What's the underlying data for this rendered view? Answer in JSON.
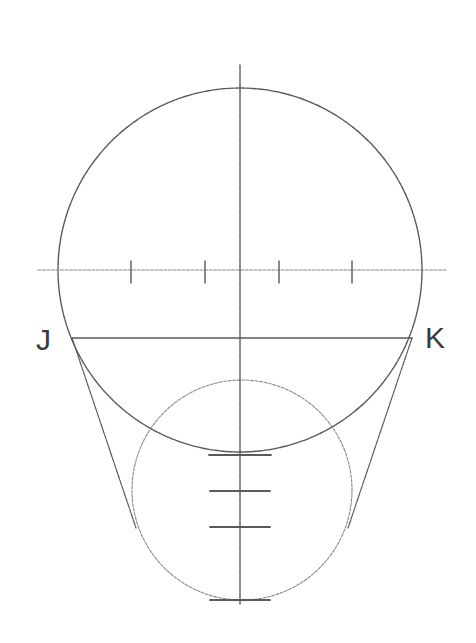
{
  "diagram": {
    "title": "",
    "labels": {
      "left": "J",
      "right": "K"
    },
    "colors": {
      "stroke": "#5a5a5a",
      "background": "#ffffff",
      "text": "#3a3a3a"
    },
    "shapes": {
      "large_circle": {
        "cx": 240,
        "cy": 270,
        "r": 182
      },
      "small_circle": {
        "cx": 242,
        "cy": 490,
        "r": 110
      },
      "vertical_axis": {
        "x": 240,
        "y1": 65,
        "y2": 605
      },
      "horizontal_axis": {
        "y": 270,
        "x1": 38,
        "x2": 446
      },
      "jk_line": {
        "y": 338,
        "x1": 72,
        "x2": 412
      },
      "horizontal_ticks_x": [
        131,
        205,
        279,
        352
      ],
      "vertical_ticks": [
        {
          "y": 455,
          "half_width": 31
        },
        {
          "y": 491,
          "half_width": 30
        },
        {
          "y": 527,
          "half_width": 30
        },
        {
          "y": 600,
          "half_width": 30
        }
      ],
      "tangent_left": {
        "x1": 72,
        "y1": 338,
        "x2": 136,
        "y2": 528
      },
      "tangent_right": {
        "x1": 412,
        "y1": 338,
        "x2": 348,
        "y2": 528
      }
    }
  }
}
